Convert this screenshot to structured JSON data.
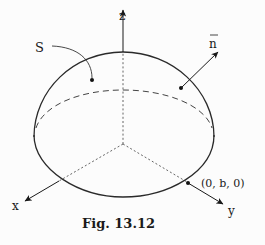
{
  "figure": {
    "caption": "Fig. 13.12",
    "labels": {
      "z_axis": "z",
      "x_axis": "x",
      "y_axis": "y",
      "surface": "S",
      "normal": "n",
      "point": "(0, b, 0)"
    },
    "colors": {
      "stroke": "#2a2a2a",
      "background": "#fcfcfc"
    }
  }
}
